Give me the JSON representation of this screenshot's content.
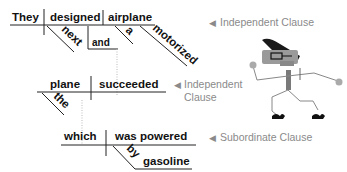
{
  "diagram": {
    "type": "sentence-diagram",
    "clause1": {
      "subject": "They",
      "verb": "designed",
      "object": "airplane",
      "modifiers": {
        "next": "next",
        "and": "and",
        "a": "a",
        "motorized": "motorized"
      },
      "label": "Independent Clause"
    },
    "clause2": {
      "subject": "plane",
      "verb": "succeeded",
      "modifiers": {
        "the": "the"
      },
      "label_line1": "Independent",
      "label_line2": "Clause"
    },
    "clause3": {
      "subject": "which",
      "verb": "was powered",
      "modifiers": {
        "by": "by",
        "gasoline": "gasoline"
      },
      "label": "Subordinate Clause"
    },
    "arrow_glyph": "◀",
    "illustration": "cartoon-stick-figure-with-glasses"
  }
}
